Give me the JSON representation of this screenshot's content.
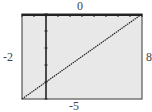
{
  "chart_data": {
    "type": "line",
    "title": "",
    "xlabel": "",
    "ylabel": "",
    "xlim": [
      -2,
      8
    ],
    "ylim": [
      -5,
      0
    ],
    "window_labels": {
      "top": "0",
      "bottom": "-5",
      "left": "-2",
      "right": "8"
    },
    "x_tick_spacing": 1,
    "y_tick_spacing": 1,
    "grid": false,
    "series": [
      {
        "name": "y = 0.5x - 4",
        "x": [
          -2,
          8
        ],
        "y": [
          -5,
          0
        ]
      }
    ]
  },
  "colors": {
    "background": "#e8e8e8",
    "frame": "#333333",
    "line": "#222222"
  }
}
